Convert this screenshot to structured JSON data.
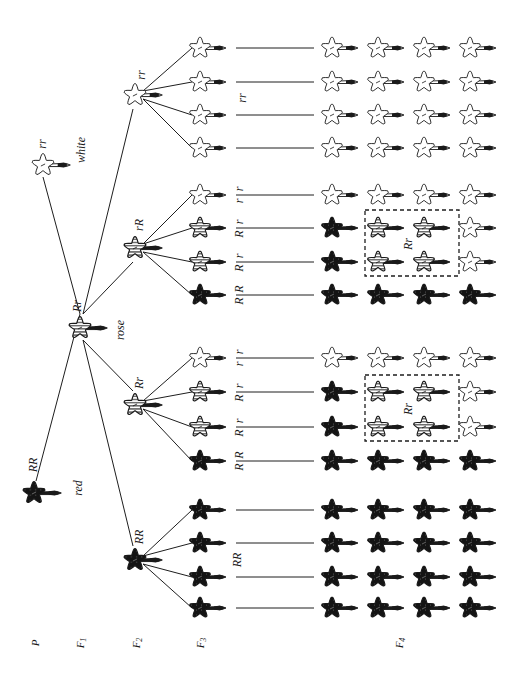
{
  "colors": {
    "red": "#141414",
    "rose": "#9a9a9a",
    "white": "#ffffff",
    "outline": "#1a1a1a"
  },
  "generation_labels": [
    {
      "text": "P",
      "sub": "",
      "x": 36,
      "y": 643
    },
    {
      "text": "F",
      "sub": "1",
      "x": 81,
      "y": 643
    },
    {
      "text": "F",
      "sub": "2",
      "x": 137,
      "y": 643
    },
    {
      "text": "F",
      "sub": "3",
      "x": 201,
      "y": 643
    },
    {
      "text": "F",
      "sub": "4",
      "x": 400,
      "y": 643
    }
  ],
  "parents": [
    {
      "id": "p-white",
      "genotype": "rr",
      "phenotype": "white",
      "color": "white",
      "x": 43,
      "y": 165,
      "gx": 43,
      "gy": 144,
      "px": 82,
      "py": 150
    },
    {
      "id": "p-red",
      "genotype": "RR",
      "phenotype": "red",
      "color": "red",
      "x": 34,
      "y": 493,
      "gx": 34,
      "gy": 465,
      "px": 79,
      "py": 488
    }
  ],
  "f1": {
    "genotype": "Rr",
    "phenotype": "rose",
    "color": "rose",
    "x": 80,
    "y": 328,
    "gx": 78,
    "gy": 306,
    "px": 121,
    "py": 330
  },
  "f2": [
    {
      "genotype": "rr",
      "color": "white",
      "x": 135,
      "y": 95,
      "gx": 142,
      "gy": 75
    },
    {
      "genotype": "rR",
      "color": "rose",
      "x": 135,
      "y": 248,
      "gx": 140,
      "gy": 225
    },
    {
      "genotype": "Rr",
      "color": "rose",
      "x": 135,
      "y": 405,
      "gx": 140,
      "gy": 383
    },
    {
      "genotype": "RR",
      "color": "red",
      "x": 135,
      "y": 560,
      "gx": 140,
      "gy": 537
    }
  ],
  "f3_groups": [
    {
      "parent": 0,
      "group_label": "rr",
      "group_label_x": 243,
      "group_label_y": 98,
      "plants": [
        {
          "color": "white",
          "y": 48,
          "label": ""
        },
        {
          "color": "white",
          "y": 82,
          "label": ""
        },
        {
          "color": "white",
          "y": 115,
          "label": ""
        },
        {
          "color": "white",
          "y": 148,
          "label": ""
        }
      ]
    },
    {
      "parent": 1,
      "group_label": "",
      "group_label_x": 0,
      "group_label_y": 0,
      "plants": [
        {
          "color": "white",
          "y": 195,
          "label": "r r"
        },
        {
          "color": "rose",
          "y": 228,
          "label": "R r"
        },
        {
          "color": "rose",
          "y": 262,
          "label": "R r"
        },
        {
          "color": "red",
          "y": 295,
          "label": "R R"
        }
      ]
    },
    {
      "parent": 2,
      "group_label": "",
      "group_label_x": 0,
      "group_label_y": 0,
      "plants": [
        {
          "color": "white",
          "y": 358,
          "label": "r r"
        },
        {
          "color": "rose",
          "y": 392,
          "label": "R r"
        },
        {
          "color": "rose",
          "y": 427,
          "label": "R r"
        },
        {
          "color": "red",
          "y": 461,
          "label": "R R"
        }
      ]
    },
    {
      "parent": 3,
      "group_label": "RR",
      "group_label_x": 238,
      "group_label_y": 560,
      "plants": [
        {
          "color": "red",
          "y": 510,
          "label": ""
        },
        {
          "color": "red",
          "y": 543,
          "label": ""
        },
        {
          "color": "red",
          "y": 577,
          "label": ""
        },
        {
          "color": "red",
          "y": 608,
          "label": ""
        }
      ]
    }
  ],
  "f3_x": 200,
  "f4_columns_x": [
    332,
    378,
    424,
    470
  ],
  "f4_rows": [
    {
      "y": 48,
      "colors": [
        "white",
        "white",
        "white",
        "white"
      ]
    },
    {
      "y": 82,
      "colors": [
        "white",
        "white",
        "white",
        "white"
      ]
    },
    {
      "y": 115,
      "colors": [
        "white",
        "white",
        "white",
        "white"
      ]
    },
    {
      "y": 148,
      "colors": [
        "white",
        "white",
        "white",
        "white"
      ]
    },
    {
      "y": 195,
      "colors": [
        "white",
        "white",
        "white",
        "white"
      ]
    },
    {
      "y": 228,
      "colors": [
        "red",
        "rose",
        "rose",
        "white"
      ]
    },
    {
      "y": 262,
      "colors": [
        "red",
        "rose",
        "rose",
        "white"
      ]
    },
    {
      "y": 295,
      "colors": [
        "red",
        "red",
        "red",
        "red"
      ]
    },
    {
      "y": 358,
      "colors": [
        "white",
        "white",
        "white",
        "white"
      ]
    },
    {
      "y": 392,
      "colors": [
        "red",
        "rose",
        "rose",
        "white"
      ]
    },
    {
      "y": 427,
      "colors": [
        "red",
        "rose",
        "rose",
        "white"
      ]
    },
    {
      "y": 461,
      "colors": [
        "red",
        "red",
        "red",
        "red"
      ]
    },
    {
      "y": 510,
      "colors": [
        "red",
        "red",
        "red",
        "red"
      ]
    },
    {
      "y": 543,
      "colors": [
        "red",
        "red",
        "red",
        "red"
      ]
    },
    {
      "y": 577,
      "colors": [
        "red",
        "red",
        "red",
        "red"
      ]
    },
    {
      "y": 608,
      "colors": [
        "red",
        "red",
        "red",
        "red"
      ]
    }
  ],
  "f3_f4_line": {
    "x1": 236,
    "x2": 314
  },
  "dashed_boxes": [
    {
      "x": 365,
      "y": 210,
      "w": 94,
      "h": 66,
      "label": "Rr",
      "lx": 409,
      "ly": 244
    },
    {
      "x": 365,
      "y": 375,
      "w": 94,
      "h": 66,
      "label": "Rr",
      "lx": 409,
      "ly": 409
    }
  ]
}
